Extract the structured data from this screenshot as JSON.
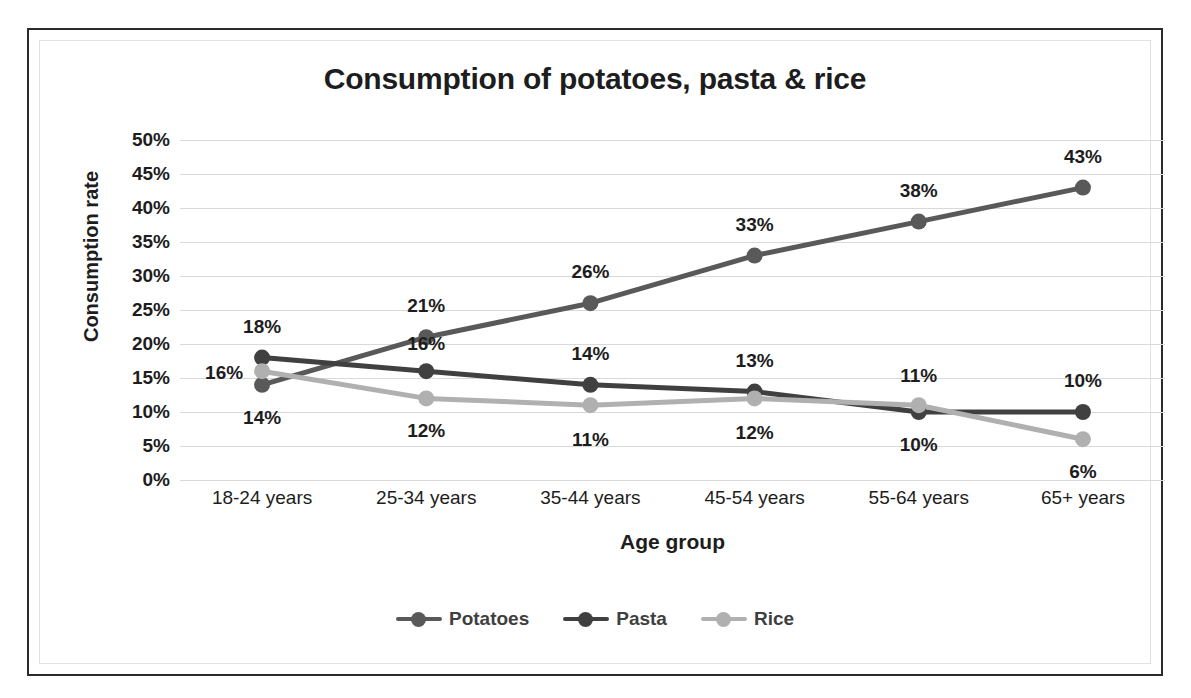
{
  "chart_data": {
    "type": "line",
    "title": "Consumption of potatoes, pasta & rice",
    "xlabel": "Age group",
    "ylabel": "Consumption rate",
    "categories": [
      "18-24 years",
      "25-34 years",
      "35-44 years",
      "45-54 years",
      "55-64 years",
      "65+ years"
    ],
    "ylim": [
      0,
      50
    ],
    "ytick_labels": [
      "50%",
      "45%",
      "40%",
      "35%",
      "30%",
      "25%",
      "20%",
      "15%",
      "10%",
      "5%",
      "0%"
    ],
    "ytick_values": [
      50,
      45,
      40,
      35,
      30,
      25,
      20,
      15,
      10,
      5,
      0
    ],
    "grid": true,
    "legend_position": "bottom",
    "series": [
      {
        "name": "Potatoes",
        "color": "#595959",
        "values": [
          14,
          21,
          26,
          33,
          38,
          43
        ],
        "labels": [
          "14%",
          "21%",
          "26%",
          "33%",
          "38%",
          "43%"
        ]
      },
      {
        "name": "Pasta",
        "color": "#404040",
        "values": [
          18,
          16,
          14,
          13,
          10,
          10
        ],
        "labels": [
          "18%",
          "16%",
          "14%",
          "13%",
          "10%",
          "10%"
        ]
      },
      {
        "name": "Rice",
        "color": "#b0b0b0",
        "values": [
          16,
          12,
          11,
          12,
          11,
          6
        ],
        "labels": [
          "16%",
          "12%",
          "11%",
          "12%",
          "11%",
          "6%"
        ]
      }
    ]
  }
}
